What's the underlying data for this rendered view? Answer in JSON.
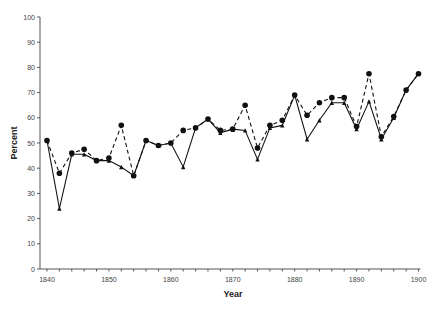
{
  "chart_data": {
    "type": "line",
    "title": "",
    "xlabel": "Year",
    "ylabel": "Percent",
    "xlim": [
      1840,
      1900
    ],
    "ylim": [
      0,
      100
    ],
    "x_ticks": [
      1840,
      1850,
      1860,
      1870,
      1880,
      1890,
      1900
    ],
    "x_minor_tick_step": 2,
    "y_ticks": [
      0,
      10,
      20,
      30,
      40,
      50,
      60,
      70,
      80,
      90,
      100
    ],
    "grid": false,
    "legend": null,
    "x": [
      1840,
      1842,
      1844,
      1846,
      1848,
      1850,
      1852,
      1854,
      1856,
      1858,
      1860,
      1862,
      1864,
      1866,
      1868,
      1870,
      1872,
      1874,
      1876,
      1878,
      1880,
      1882,
      1884,
      1886,
      1888,
      1890,
      1892,
      1894,
      1896,
      1898,
      1900
    ],
    "series": [
      {
        "name": "Series 1 (dashed, circle markers)",
        "line_style": "dashed",
        "marker": "circle",
        "values": [
          51,
          38,
          46,
          47.5,
          43,
          44,
          57,
          37,
          51,
          49,
          50,
          55,
          56,
          59.5,
          55,
          55.5,
          65,
          48,
          57,
          59,
          69,
          61,
          66,
          68,
          68,
          56.5,
          77.5,
          52.5,
          60.5,
          71,
          77.5
        ]
      },
      {
        "name": "Series 2 (solid, triangle markers)",
        "line_style": "solid",
        "marker": "triangle",
        "values": [
          51,
          24,
          45.5,
          45.5,
          43,
          43,
          40.5,
          37,
          51,
          49,
          50,
          40.5,
          56,
          59.5,
          54,
          55.5,
          55,
          43.5,
          56,
          57,
          69,
          51.5,
          59,
          66,
          66,
          55.5,
          66.5,
          51.5,
          60,
          71,
          77.5
        ]
      }
    ]
  },
  "axes": {
    "x_title": "Year",
    "y_title": "Percent"
  }
}
